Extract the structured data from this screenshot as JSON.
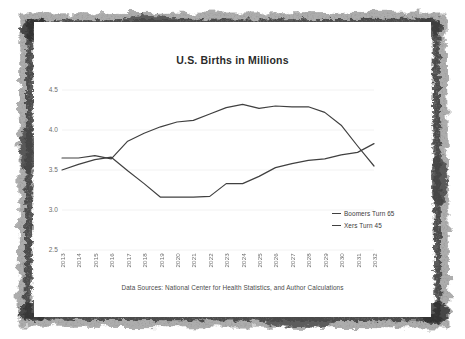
{
  "chart_data": {
    "type": "line",
    "title": "U.S. Births in Millions",
    "xlabel": "",
    "ylabel": "",
    "ylim": [
      2.5,
      4.5
    ],
    "yticks": [
      "2.5",
      "3.0",
      "3.5",
      "4.0",
      "4.5"
    ],
    "grid": true,
    "legend_position": "inside-bottom-right",
    "categories": [
      "2013",
      "2014",
      "2015",
      "2016",
      "2017",
      "2018",
      "2019",
      "2020",
      "2021",
      "2022",
      "2023",
      "2024",
      "2025",
      "2026",
      "2027",
      "2028",
      "2029",
      "2030",
      "2031",
      "2032"
    ],
    "series": [
      {
        "name": "Boomers Turn 65",
        "values": [
          3.65,
          3.65,
          3.68,
          3.64,
          3.86,
          3.96,
          4.04,
          4.1,
          4.12,
          4.2,
          4.28,
          4.32,
          4.27,
          4.3,
          4.29,
          4.29,
          4.22,
          4.06,
          3.8,
          3.55
        ]
      },
      {
        "name": "Xers Turn 45",
        "values": [
          3.5,
          3.57,
          3.63,
          3.66,
          3.49,
          3.33,
          3.16,
          3.16,
          3.16,
          3.17,
          3.33,
          3.33,
          3.42,
          3.53,
          3.58,
          3.62,
          3.64,
          3.69,
          3.72,
          3.83
        ]
      }
    ],
    "source_note": "Data Sources:  National Center for Health Statistics, and Author Calculations"
  },
  "legend": {
    "items": [
      {
        "label": "Boomers Turn 65"
      },
      {
        "label": "Xers Turn 45"
      }
    ]
  },
  "colors": {
    "line": "#404040",
    "grid": "#f2f2f2",
    "tick_text": "#6d6d6d",
    "title_text": "#2b2b2b",
    "border": "#3a3a3a"
  }
}
